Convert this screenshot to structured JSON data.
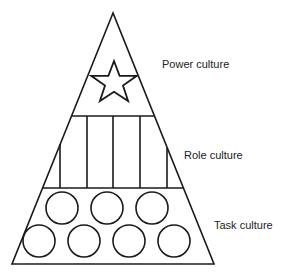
{
  "diagram": {
    "layers": [
      {
        "label": "Power culture",
        "symbol": "star-icon"
      },
      {
        "label": "Role culture",
        "symbol": "pillars"
      },
      {
        "label": "Task culture",
        "symbol": "circles",
        "count": 7
      }
    ],
    "stroke_color": "#1a1a1a"
  }
}
